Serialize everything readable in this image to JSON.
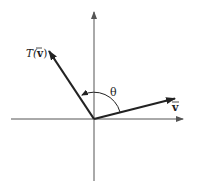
{
  "diagram": {
    "type": "vector-rotation",
    "labels": {
      "transformed_vector": "T(v⃗)",
      "transformed_vector_func": "T(",
      "transformed_vector_arg": "v",
      "transformed_vector_close": ")",
      "original_vector": "v",
      "angle": "θ"
    },
    "colors": {
      "axis": "#555555",
      "vector": "#222222",
      "background": "#ffffff"
    },
    "geometry": {
      "origin": [
        94,
        119
      ],
      "x_axis": {
        "from": [
          11,
          119
        ],
        "to": [
          184,
          119
        ]
      },
      "y_axis": {
        "from": [
          94,
          181
        ],
        "to": [
          94,
          11
        ]
      },
      "vector_v": {
        "to": [
          176,
          98
        ]
      },
      "vector_Tv": {
        "to": [
          48,
          50
        ]
      }
    }
  }
}
